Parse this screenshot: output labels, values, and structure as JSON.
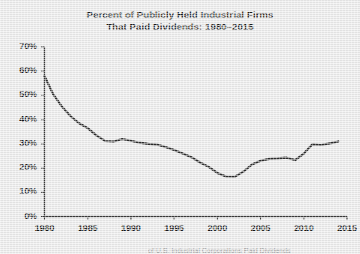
{
  "title": {
    "line1": "Percent of Publicly Held Industrial Firms",
    "line2": "That Paid Dividends: 1980–2015"
  },
  "caption": {
    "text": "of U.S. Industrial Corporations Paid Dividends"
  },
  "colors": {
    "background": "#e9e9e9",
    "line": "#2b2b2b",
    "axis": "#3a3a3a",
    "text": "#171717"
  },
  "chart_data": {
    "type": "line",
    "title": "Percent of Publicly Held Industrial Firms That Paid Dividends: 1980–2015",
    "xlabel": "",
    "ylabel": "",
    "xlim": [
      1980,
      2015
    ],
    "ylim": [
      0,
      70
    ],
    "grid": false,
    "legend": false,
    "ytick_labels": [
      "0%",
      "10%",
      "20%",
      "30%",
      "40%",
      "50%",
      "60%",
      "70%"
    ],
    "ytick_values": [
      0,
      10,
      20,
      30,
      40,
      50,
      60,
      70
    ],
    "xtick_labels": [
      "1980",
      "1985",
      "1990",
      "1995",
      "2000",
      "2005",
      "2010",
      "2015"
    ],
    "xtick_values": [
      1980,
      1985,
      1990,
      1995,
      2000,
      2005,
      2010,
      2015
    ],
    "series": [
      {
        "name": "Percent paying dividends",
        "x": [
          1980,
          1981,
          1982,
          1983,
          1984,
          1985,
          1986,
          1987,
          1988,
          1989,
          1990,
          1991,
          1992,
          1993,
          1994,
          1995,
          1996,
          1997,
          1998,
          1999,
          2000,
          2001,
          2002,
          2003,
          2004,
          2005,
          2006,
          2007,
          2008,
          2009,
          2010,
          2011,
          2012,
          2013,
          2014
        ],
        "values": [
          58.0,
          50.5,
          45.5,
          41.5,
          38.5,
          36.5,
          33.5,
          31.2,
          31.0,
          32.0,
          31.3,
          30.5,
          30.0,
          29.7,
          28.7,
          27.5,
          26.0,
          24.5,
          22.3,
          20.5,
          18.0,
          16.5,
          16.4,
          18.5,
          21.5,
          23.0,
          23.8,
          24.0,
          24.3,
          23.3,
          26.0,
          29.8,
          29.5,
          30.2,
          31.0
        ]
      }
    ]
  }
}
